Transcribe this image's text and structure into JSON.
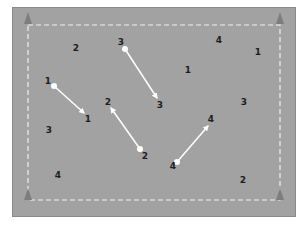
{
  "diagram": {
    "field_color": "#a2a2a2",
    "boundary": {
      "x1": 28,
      "y1": 25,
      "x2": 280,
      "y2": 200,
      "style": "dashed",
      "color": "#f0f0f0"
    },
    "cones": [
      {
        "name": "cone-top-left",
        "x": 28,
        "y": 20
      },
      {
        "name": "cone-top-right",
        "x": 280,
        "y": 20
      },
      {
        "name": "cone-bottom-left",
        "x": 28,
        "y": 196
      },
      {
        "name": "cone-bottom-right",
        "x": 280,
        "y": 196
      }
    ],
    "arrows": [
      {
        "id": "1",
        "from": {
          "x": 54,
          "y": 86
        },
        "to": {
          "x": 84,
          "y": 113
        }
      },
      {
        "id": "2",
        "from": {
          "x": 140,
          "y": 149
        },
        "to": {
          "x": 111,
          "y": 108
        }
      },
      {
        "id": "3",
        "from": {
          "x": 125,
          "y": 49
        },
        "to": {
          "x": 157,
          "y": 98
        }
      },
      {
        "id": "4",
        "from": {
          "x": 177,
          "y": 162
        },
        "to": {
          "x": 208,
          "y": 126
        }
      }
    ],
    "labels": [
      {
        "text": "1",
        "x": 48,
        "y": 81
      },
      {
        "text": "1",
        "x": 88,
        "y": 119
      },
      {
        "text": "2",
        "x": 108,
        "y": 102
      },
      {
        "text": "2",
        "x": 145,
        "y": 156
      },
      {
        "text": "3",
        "x": 121,
        "y": 42
      },
      {
        "text": "3",
        "x": 160,
        "y": 105
      },
      {
        "text": "4",
        "x": 173,
        "y": 166
      },
      {
        "text": "4",
        "x": 211,
        "y": 119
      },
      {
        "text": "2",
        "x": 76,
        "y": 48
      },
      {
        "text": "4",
        "x": 219,
        "y": 40
      },
      {
        "text": "1",
        "x": 258,
        "y": 52
      },
      {
        "text": "1",
        "x": 188,
        "y": 70
      },
      {
        "text": "3",
        "x": 244,
        "y": 102
      },
      {
        "text": "3",
        "x": 49,
        "y": 130
      },
      {
        "text": "4",
        "x": 58,
        "y": 175
      },
      {
        "text": "2",
        "x": 243,
        "y": 180
      }
    ]
  }
}
